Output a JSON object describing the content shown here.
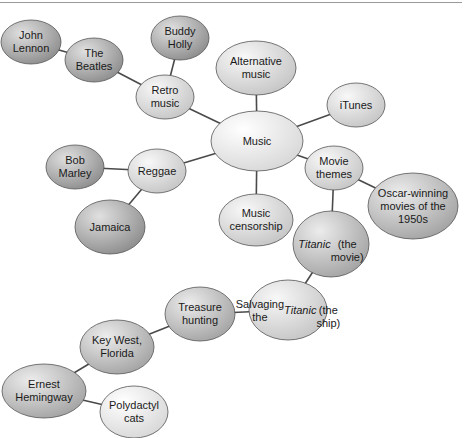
{
  "diagram": {
    "type": "mind-map",
    "center": "Music",
    "nodes": [
      {
        "id": "john_lennon",
        "label": "John\nLennon",
        "cx": 31,
        "cy": 42,
        "rx": 30,
        "ry": 22,
        "shade": "dark"
      },
      {
        "id": "the_beatles",
        "label": "The\nBeatles",
        "cx": 94,
        "cy": 60,
        "rx": 29,
        "ry": 22,
        "shade": "dark"
      },
      {
        "id": "buddy_holly",
        "label": "Buddy\nHolly",
        "cx": 180,
        "cy": 38,
        "rx": 29,
        "ry": 22,
        "shade": "dark"
      },
      {
        "id": "retro_music",
        "label": "Retro\nmusic",
        "cx": 165,
        "cy": 97,
        "rx": 29,
        "ry": 22,
        "shade": "light"
      },
      {
        "id": "alternative_music",
        "label": "Alternative\nmusic",
        "cx": 256,
        "cy": 68,
        "rx": 40,
        "ry": 27,
        "shade": "light"
      },
      {
        "id": "itunes",
        "label": "iTunes",
        "cx": 356,
        "cy": 105,
        "rx": 29,
        "ry": 22,
        "shade": "light"
      },
      {
        "id": "music",
        "label": "Music",
        "cx": 257,
        "cy": 141,
        "rx": 46,
        "ry": 30,
        "shade": "lightest"
      },
      {
        "id": "bob_marley",
        "label": "Bob\nMarley",
        "cx": 75,
        "cy": 167,
        "rx": 29,
        "ry": 22,
        "shade": "dark"
      },
      {
        "id": "reggae",
        "label": "Reggae",
        "cx": 157,
        "cy": 171,
        "rx": 29,
        "ry": 22,
        "shade": "light"
      },
      {
        "id": "jamaica",
        "label": "Jamaica",
        "cx": 110,
        "cy": 227,
        "rx": 35,
        "ry": 27,
        "shade": "dark"
      },
      {
        "id": "music_censorship",
        "label": "Music\ncensorship",
        "cx": 256,
        "cy": 220,
        "rx": 37,
        "ry": 26,
        "shade": "light"
      },
      {
        "id": "movie_themes",
        "label": "Movie\nthemes",
        "cx": 334,
        "cy": 168,
        "rx": 29,
        "ry": 22,
        "shade": "light"
      },
      {
        "id": "oscar_winning",
        "label": "Oscar-winning\nmovies of the\n1950s",
        "cx": 413,
        "cy": 206,
        "rx": 45,
        "ry": 33,
        "shade": "mid"
      },
      {
        "id": "titanic_movie",
        "label_html": "<i>Titanic</i><br>(the<br>movie)",
        "label": "Titanic (the movie)",
        "cx": 331,
        "cy": 244,
        "rx": 38,
        "ry": 33,
        "shade": "mid"
      },
      {
        "id": "salvaging",
        "label_html": "Salvaging<br>the <i>Titanic</i><br>(the ship)",
        "label": "Salvaging the Titanic (the ship)",
        "cx": 288,
        "cy": 310,
        "rx": 39,
        "ry": 30,
        "shade": "light"
      },
      {
        "id": "treasure_hunting",
        "label": "Treasure\nhunting",
        "cx": 200,
        "cy": 314,
        "rx": 35,
        "ry": 27,
        "shade": "mid"
      },
      {
        "id": "key_west",
        "label": "Key West,\nFlorida",
        "cx": 117,
        "cy": 347,
        "rx": 37,
        "ry": 27,
        "shade": "mid"
      },
      {
        "id": "ernest_hemingway",
        "label": "Ernest\nHemingway",
        "cx": 44,
        "cy": 391,
        "rx": 42,
        "ry": 27,
        "shade": "mid"
      },
      {
        "id": "polydactyl_cats",
        "label": "Polydactyl\ncats",
        "cx": 134,
        "cy": 412,
        "rx": 34,
        "ry": 26,
        "shade": "lightest"
      }
    ],
    "edges": [
      [
        "john_lennon",
        "the_beatles"
      ],
      [
        "the_beatles",
        "retro_music"
      ],
      [
        "buddy_holly",
        "retro_music"
      ],
      [
        "retro_music",
        "music"
      ],
      [
        "alternative_music",
        "music"
      ],
      [
        "itunes",
        "music"
      ],
      [
        "music",
        "reggae"
      ],
      [
        "bob_marley",
        "reggae"
      ],
      [
        "reggae",
        "jamaica"
      ],
      [
        "music",
        "music_censorship"
      ],
      [
        "music",
        "movie_themes"
      ],
      [
        "movie_themes",
        "oscar_winning"
      ],
      [
        "movie_themes",
        "titanic_movie"
      ],
      [
        "titanic_movie",
        "salvaging"
      ],
      [
        "salvaging",
        "treasure_hunting"
      ],
      [
        "treasure_hunting",
        "key_west"
      ],
      [
        "key_west",
        "ernest_hemingway"
      ],
      [
        "ernest_hemingway",
        "polydactyl_cats"
      ]
    ],
    "colors": {
      "edge": "#4a4a4a",
      "outline": "#555555",
      "dark": [
        "#e0e0e0",
        "#8e8e8e"
      ],
      "mid": [
        "#ececec",
        "#a4a4a4"
      ],
      "light": [
        "#f8f8f8",
        "#c6c6c6"
      ],
      "lightest": [
        "#ffffff",
        "#d8d8d8"
      ]
    }
  }
}
